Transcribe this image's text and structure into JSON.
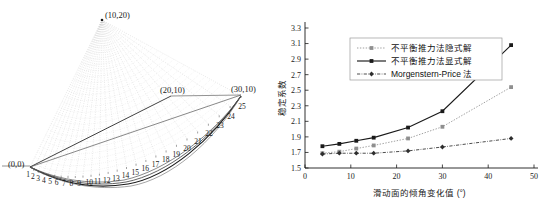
{
  "figure": {
    "left": {
      "name": "slip-surface-slice-diagram",
      "point_labels": [
        {
          "text": "(10,20)",
          "x": 105,
          "y": 11
        },
        {
          "text": "(20,10)",
          "x": 160,
          "y": 86
        },
        {
          "text": "(30,10)",
          "x": 231,
          "y": 85
        },
        {
          "text": "(0,0)",
          "x": 8,
          "y": 160
        }
      ],
      "slice_numbers": [
        "1",
        "2",
        "3",
        "4",
        "5",
        "6",
        "7",
        "8",
        "9",
        "10",
        "11",
        "12",
        "13",
        "14",
        "15",
        "16",
        "17",
        "18",
        "19",
        "20",
        "21",
        "22",
        "23",
        "24",
        "25"
      ],
      "fan_apex": {
        "x": 102,
        "y": 20
      },
      "colors": {
        "fan": "#c9c9c9",
        "surface": "#2b2b2b",
        "outline": "#555555"
      }
    },
    "right": {
      "name": "stability-coefficient-chart"
    }
  },
  "chart_data": {
    "type": "line",
    "title": "",
    "xlabel": "滑动面的倾角变化值 (°)",
    "ylabel": "稳定系数",
    "xlim": [
      0,
      50
    ],
    "ylim": [
      1.5,
      3.3
    ],
    "xticks": [
      0,
      10,
      20,
      30,
      40,
      50
    ],
    "xtick_labels": [
      "0",
      "10",
      "20",
      "30",
      "40",
      "50"
    ],
    "yticks": [
      1.5,
      1.7,
      1.9,
      2.1,
      2.3,
      2.5,
      2.7,
      2.9,
      3.1,
      3.3
    ],
    "ytick_labels": [
      "1.5",
      "1.7",
      "1.9",
      "2.1",
      "2.3",
      "2.5",
      "2.7",
      "2.9",
      "3.1",
      "3.3"
    ],
    "grid": false,
    "legend_position": "upper-center",
    "x": [
      3.8,
      7.5,
      11.2,
      15.0,
      22.5,
      30.0,
      45.0
    ],
    "series": [
      {
        "name": "不平衡推力法隐式解",
        "style": "dotted",
        "marker": "square",
        "color": "#8f8f8f",
        "values": [
          1.69,
          1.71,
          1.75,
          1.79,
          1.88,
          2.03,
          2.54
        ]
      },
      {
        "name": "不平衡推力法显式解",
        "style": "solid",
        "marker": "square",
        "color": "#1a1a1a",
        "values": [
          1.78,
          1.81,
          1.85,
          1.89,
          2.02,
          2.23,
          3.08
        ]
      },
      {
        "name": "Morgenstern-Price 法",
        "style": "dash-dot",
        "marker": "diamond",
        "color": "#2e2e2e",
        "values": [
          1.68,
          1.69,
          1.69,
          1.69,
          1.72,
          1.77,
          1.88
        ]
      }
    ]
  }
}
